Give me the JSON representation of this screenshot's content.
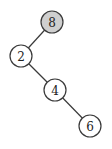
{
  "tree": {
    "type": "binary-search-tree",
    "highlight_color": "#cfcfcf",
    "node_fill": "#ffffff",
    "nodes": [
      {
        "id": "n8",
        "label": "8",
        "x": 52,
        "y": 22,
        "highlighted": true
      },
      {
        "id": "n2",
        "label": "2",
        "x": 21,
        "y": 56,
        "highlighted": false
      },
      {
        "id": "n4",
        "label": "4",
        "x": 55,
        "y": 90,
        "highlighted": false
      },
      {
        "id": "n6",
        "label": "6",
        "x": 90,
        "y": 126,
        "highlighted": false
      }
    ],
    "edges": [
      {
        "from": "n8",
        "to": "n2"
      },
      {
        "from": "n2",
        "to": "n4"
      },
      {
        "from": "n4",
        "to": "n6"
      }
    ]
  }
}
